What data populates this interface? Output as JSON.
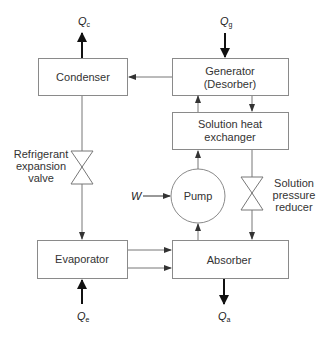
{
  "diagram": {
    "components": {
      "condenser": {
        "label": "Condenser"
      },
      "generator": {
        "line1": "Generator",
        "line2": "(Desorber)"
      },
      "heat_exchanger": {
        "line1": "Solution heat",
        "line2": "exchanger"
      },
      "pump": {
        "label": "Pump"
      },
      "evaporator": {
        "label": "Evaporator"
      },
      "absorber": {
        "label": "Absorber"
      },
      "refrigerant_valve": {
        "line1": "Refrigerant",
        "line2": "expansion",
        "line3": "valve"
      },
      "pressure_reducer": {
        "line1": "Solution",
        "line2": "pressure",
        "line3": "reducer"
      }
    },
    "heat_flows": {
      "condenser": {
        "symbol": "Q",
        "sub": "c",
        "direction": "out"
      },
      "generator": {
        "symbol": "Q",
        "sub": "g",
        "direction": "in"
      },
      "evaporator": {
        "symbol": "Q",
        "sub": "e",
        "direction": "in"
      },
      "absorber": {
        "symbol": "Q",
        "sub": "a",
        "direction": "out"
      }
    },
    "work_input": {
      "symbol": "W"
    },
    "colors": {
      "box_stroke": "#8a8a8a",
      "line": "#777777",
      "heat_arrow": "#111111",
      "text": "#333333"
    }
  }
}
